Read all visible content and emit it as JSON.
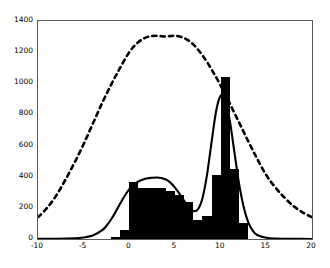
{
  "chart_data": {
    "type": "bar",
    "title": "",
    "xlabel": "",
    "ylabel": "",
    "xlim": [
      -10,
      20
    ],
    "ylim": [
      0,
      1400
    ],
    "grid": false,
    "legend": "none",
    "xticks": [
      -10,
      -5,
      0,
      5,
      10,
      15,
      20
    ],
    "xtick_labels": [
      "-10",
      "-5",
      "0",
      "5",
      "10",
      "15",
      "20"
    ],
    "yticks": [
      0,
      200,
      400,
      600,
      800,
      1000,
      1200,
      1400
    ],
    "ytick_labels": [
      "0",
      "200",
      "400",
      "600",
      "800",
      "1000",
      "1200",
      "1400"
    ],
    "histogram": {
      "name": "histogram",
      "color": "#000000",
      "bin_width": 1,
      "bin_left_edges": [
        -2,
        -1,
        0,
        1,
        2,
        3,
        4,
        5,
        6,
        7,
        8,
        9,
        10,
        11,
        12
      ],
      "values": [
        10,
        55,
        365,
        325,
        330,
        330,
        310,
        280,
        240,
        120,
        150,
        410,
        1040,
        450,
        100
      ]
    },
    "series": [
      {
        "name": "bimodal-fit-solid",
        "style": "solid",
        "color": "#000000",
        "x": [
          -10,
          -8,
          -6,
          -5,
          -4,
          -3,
          -2.5,
          -2,
          -1.5,
          -1,
          -0.5,
          0,
          0.5,
          1,
          1.5,
          2,
          2.5,
          3,
          3.5,
          4,
          4.5,
          5,
          5.5,
          6,
          6.5,
          7,
          7.5,
          8,
          8.5,
          9,
          9.5,
          10,
          10.5,
          11,
          11.5,
          12,
          12.5,
          13,
          13.5,
          14,
          15,
          16,
          18,
          20
        ],
        "y": [
          1,
          2,
          5,
          10,
          22,
          55,
          85,
          125,
          175,
          228,
          278,
          320,
          350,
          370,
          382,
          390,
          393,
          395,
          392,
          382,
          362,
          330,
          290,
          245,
          205,
          180,
          190,
          260,
          410,
          620,
          820,
          920,
          900,
          760,
          560,
          360,
          210,
          110,
          55,
          26,
          8,
          3,
          1,
          0
        ]
      },
      {
        "name": "overall-gaussian-dashed",
        "style": "dashed",
        "color": "#000000",
        "x": [
          -10,
          -9,
          -8,
          -7,
          -6,
          -5,
          -4,
          -3,
          -2,
          -1,
          0,
          1,
          2,
          3,
          4,
          5,
          6,
          7,
          8,
          9,
          10,
          11,
          12,
          13,
          14,
          15,
          16,
          17,
          18,
          19,
          20
        ],
        "y": [
          140,
          200,
          280,
          380,
          490,
          610,
          740,
          870,
          990,
          1100,
          1200,
          1265,
          1298,
          1305,
          1300,
          1305,
          1290,
          1250,
          1180,
          1090,
          985,
          870,
          750,
          630,
          515,
          410,
          330,
          265,
          210,
          170,
          140
        ]
      }
    ]
  }
}
